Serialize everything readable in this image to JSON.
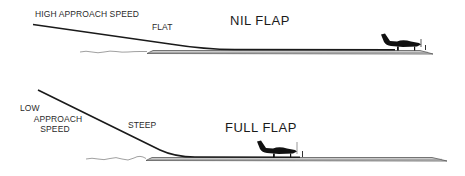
{
  "panels": [
    {
      "title": "NIL FLAP",
      "speed_label": "HIGH APPROACH SPEED",
      "slope_label": "FLAT",
      "approach_angle": "flat",
      "icon": "airplane-icon"
    },
    {
      "title": "FULL FLAP",
      "speed_label_lines": [
        "LOW",
        "APPROACH",
        "SPEED"
      ],
      "slope_label": "STEEP",
      "approach_angle": "steep",
      "icon": "airplane-icon"
    }
  ],
  "colors": {
    "line": "#1a1a1a",
    "runway": "#555555",
    "runway_fill": "#d9d9d9",
    "ground": "#777777",
    "text": "#2a2a2a"
  }
}
